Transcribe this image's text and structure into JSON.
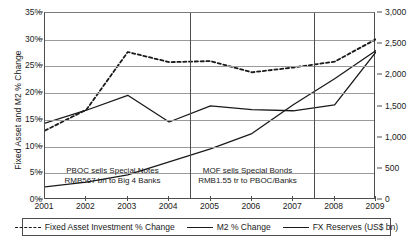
{
  "chart_data": {
    "type": "line",
    "title": "",
    "xlabel": "",
    "ylabel": "Fixed Asset and M2 % Change",
    "y2label": "FX Reserves (US$ bn)",
    "grid": true,
    "legend_position": "bottom",
    "categories": [
      "2001",
      "2002",
      "2003",
      "2004",
      "2005",
      "2006",
      "2007",
      "2008",
      "2009"
    ],
    "ylim": [
      0,
      35
    ],
    "y2lim": [
      0,
      3000
    ],
    "yticks": [
      "0%",
      "5%",
      "10%",
      "15%",
      "20%",
      "25%",
      "30%",
      "35%"
    ],
    "ytick_values": [
      0,
      5,
      10,
      15,
      20,
      25,
      30,
      35
    ],
    "y2ticks": [
      "0",
      "500",
      "1,000",
      "1,500",
      "2,000",
      "2,500",
      "3,000"
    ],
    "y2tick_values": [
      0,
      500,
      1000,
      1500,
      2000,
      2500,
      3000
    ],
    "series": [
      {
        "name": "Fixed Asset Investment % Change",
        "axis": "left",
        "style": "dashed",
        "values": [
          13.0,
          16.9,
          27.7,
          25.8,
          26.0,
          23.9,
          24.8,
          25.9,
          30.1
        ]
      },
      {
        "name": "M2 % Change",
        "axis": "left",
        "style": "solid",
        "values": [
          14.4,
          16.8,
          19.6,
          14.6,
          17.6,
          16.9,
          16.7,
          17.8,
          27.7
        ]
      },
      {
        "name": "FX Reserves (US$ bn)",
        "axis": "right",
        "style": "solid",
        "values": [
          212,
          286,
          403,
          610,
          819,
          1066,
          1528,
          1946,
          2399
        ]
      }
    ],
    "annotations": [
      {
        "id": "pboc-special-notes",
        "line1": "PBOC sells Special Notes",
        "line2": "RMB567 bn to Big 4 Banks",
        "marker_year": "2003.5"
      },
      {
        "id": "mof-special-bonds",
        "line1": "MOF sells Special Bonds",
        "line2": "RMB1.55 tr to PBOC/Banks",
        "marker_year": "2007.5"
      }
    ],
    "event_markers": [
      3.5,
      6.5
    ]
  },
  "legend": {
    "items": [
      {
        "label": "Fixed Asset Investment % Change",
        "style": "dashed"
      },
      {
        "label": "M2 % Change",
        "style": "solid"
      },
      {
        "label": "FX Reserves (US$  bn)",
        "style": "solid"
      }
    ]
  },
  "colors": {
    "line": "#1a1a1a",
    "grid": "#9a9a9a",
    "axis": "#4d4d4d",
    "background": "#ffffff"
  }
}
